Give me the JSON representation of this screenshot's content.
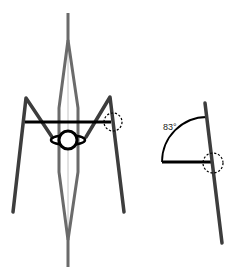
{
  "diagram": {
    "left_figure": {
      "description": "front view of frame with legs, crossbar and central hub",
      "colors": {
        "legs": "#3d3d3d",
        "spine": "#6e6e6e",
        "spine_inner": "#bdbdbd",
        "crossbar": "#000000",
        "hub": "#000000"
      }
    },
    "right_figure": {
      "description": "side view of inclined pole with horizontal bar and angle arc",
      "angle_label": "83°",
      "colors": {
        "pole": "#3d3d3d",
        "bar": "#000000",
        "arc": "#000000"
      }
    },
    "joint_marker": "dashed-circle"
  }
}
